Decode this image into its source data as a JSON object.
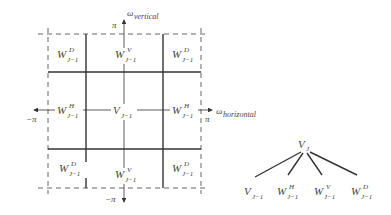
{
  "diagram": {
    "type": "2D wavelet frequency-domain partition with decomposition tree",
    "axes": {
      "vertical": {
        "symbol": "ω",
        "subscript": "vertical",
        "top_label": "π",
        "bottom_label": "−π"
      },
      "horizontal": {
        "symbol": "ω",
        "subscript": "horizontal",
        "left_label": "−π",
        "right_label": "π"
      }
    },
    "grid": {
      "rows": [
        [
          {
            "base": "W",
            "sup": "D",
            "sub": "J−1"
          },
          {
            "base": "W",
            "sup": "V",
            "sub": "J−1"
          },
          {
            "base": "W",
            "sup": "D",
            "sub": "J−1"
          }
        ],
        [
          {
            "base": "W",
            "sup": "H",
            "sub": "J−1"
          },
          {
            "base": "V",
            "sup": "",
            "sub": "J−1"
          },
          {
            "base": "W",
            "sup": "H",
            "sub": "J−1"
          }
        ],
        [
          {
            "base": "W",
            "sup": "D",
            "sub": "J−1"
          },
          {
            "base": "W",
            "sup": "V",
            "sub": "J−1"
          },
          {
            "base": "W",
            "sup": "D",
            "sub": "J−1"
          }
        ]
      ]
    },
    "tree": {
      "root": {
        "base": "V",
        "sup": "",
        "sub": "J"
      },
      "children": [
        {
          "base": "V",
          "sup": "",
          "sub": "J−1"
        },
        {
          "base": "W",
          "sup": "H",
          "sub": "J−1"
        },
        {
          "base": "W",
          "sup": "V",
          "sub": "J−1"
        },
        {
          "base": "W",
          "sup": "D",
          "sub": "J−1"
        }
      ]
    },
    "colors": {
      "line": "#333333",
      "dashed": "#666666",
      "text": "#444444"
    }
  }
}
